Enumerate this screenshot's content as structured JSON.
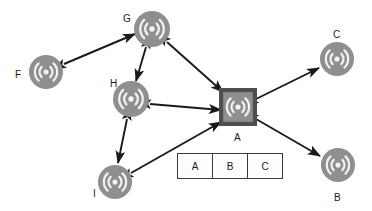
{
  "diagram": {
    "type": "node-link-diagram",
    "colors": {
      "node_fill": "#8f8f8f",
      "node_icon": "#f2f2f2",
      "gateway_square_fill": "#4f4f4f",
      "gateway_inner_fill": "#8f8f8f",
      "edge": "#1a1a1a",
      "background": "#ffffff",
      "label_text": "#1a1a1a",
      "table_border": "#3a3a3a",
      "table_fill": "#fdfdfd"
    },
    "nodes": [
      {
        "id": "A",
        "label": "A",
        "shape": "square-radio",
        "x": 238,
        "y": 107,
        "label_x": 234,
        "label_y": 133
      },
      {
        "id": "B",
        "label": "B",
        "shape": "circle-radio",
        "x": 338,
        "y": 165,
        "label_x": 334,
        "label_y": 193
      },
      {
        "id": "C",
        "label": "C",
        "shape": "circle-radio",
        "x": 337,
        "y": 59,
        "label_x": 333,
        "label_y": 30
      },
      {
        "id": "F",
        "label": "F",
        "shape": "circle-radio",
        "x": 46,
        "y": 72,
        "label_x": 15,
        "label_y": 70
      },
      {
        "id": "G",
        "label": "G",
        "shape": "circle-radio",
        "x": 152,
        "y": 29,
        "label_x": 123,
        "label_y": 14
      },
      {
        "id": "H",
        "label": "H",
        "shape": "circle-radio",
        "x": 131,
        "y": 99,
        "label_x": 110,
        "label_y": 79
      },
      {
        "id": "I",
        "label": "I",
        "shape": "circle-radio",
        "x": 115,
        "y": 182,
        "label_x": 93,
        "label_y": 189
      }
    ],
    "edges": [
      {
        "from": "F",
        "to": "G",
        "arrow": "both"
      },
      {
        "from": "G",
        "to": "H",
        "arrow": "both"
      },
      {
        "from": "G",
        "to": "A",
        "arrow": "both"
      },
      {
        "from": "H",
        "to": "A",
        "arrow": "both"
      },
      {
        "from": "H",
        "to": "I",
        "arrow": "both"
      },
      {
        "from": "I",
        "to": "A",
        "arrow": "both"
      },
      {
        "from": "A",
        "to": "C",
        "arrow": "both"
      },
      {
        "from": "A",
        "to": "B",
        "arrow": "both"
      }
    ]
  },
  "routing_table": {
    "x": 177,
    "y": 153,
    "cells": [
      "A",
      "B",
      "C"
    ]
  }
}
